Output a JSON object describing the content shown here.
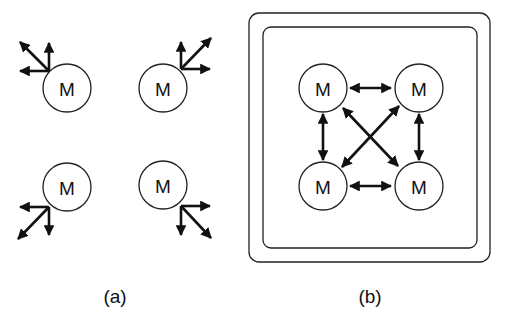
{
  "figure": {
    "panels": [
      {
        "id": "a",
        "caption": "(a)",
        "description": "Four isolated modules, each with three outward arrows",
        "modules": [
          {
            "label": "M",
            "position": "top-left"
          },
          {
            "label": "M",
            "position": "top-right"
          },
          {
            "label": "M",
            "position": "bottom-left"
          },
          {
            "label": "M",
            "position": "bottom-right"
          }
        ]
      },
      {
        "id": "b",
        "caption": "(b)",
        "description": "Four modules fully interconnected with bidirectional arrows inside a double rounded border",
        "modules": [
          {
            "label": "M",
            "position": "top-left"
          },
          {
            "label": "M",
            "position": "top-right"
          },
          {
            "label": "M",
            "position": "bottom-left"
          },
          {
            "label": "M",
            "position": "bottom-right"
          }
        ],
        "connections": [
          {
            "from": "top-left",
            "to": "top-right",
            "type": "bidirectional"
          },
          {
            "from": "bottom-left",
            "to": "bottom-right",
            "type": "bidirectional"
          },
          {
            "from": "top-left",
            "to": "bottom-left",
            "type": "bidirectional"
          },
          {
            "from": "top-right",
            "to": "bottom-right",
            "type": "bidirectional"
          },
          {
            "from": "top-left",
            "to": "bottom-right",
            "type": "bidirectional"
          },
          {
            "from": "top-right",
            "to": "bottom-left",
            "type": "bidirectional"
          }
        ]
      }
    ]
  }
}
